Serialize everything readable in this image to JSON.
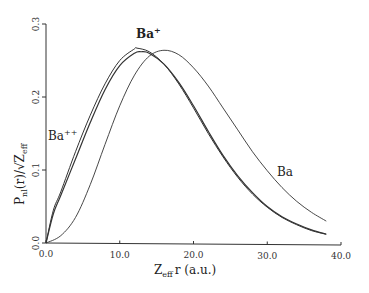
{
  "chart_data": {
    "type": "line",
    "title": "",
    "xlabel": "Z_eff r (a.u.)",
    "ylabel": "P_nl(r)/√Z_eff",
    "xlim": [
      0,
      40
    ],
    "ylim": [
      0,
      0.3
    ],
    "x_ticks": [
      "0.0",
      "10.0",
      "20.0",
      "30.0",
      "40.0"
    ],
    "y_ticks": [
      "0.0",
      "0.1",
      "0.2",
      "0.3"
    ],
    "grid": false,
    "legend": "inline labels",
    "series": [
      {
        "name": "Ba++",
        "label": "Ba⁺⁺",
        "x": [
          0,
          1,
          2,
          4,
          6,
          8,
          10,
          12,
          12.3,
          14,
          16,
          18,
          20,
          22,
          24,
          26,
          28,
          30,
          32,
          34,
          36,
          38
        ],
        "y": [
          0,
          0.045,
          0.07,
          0.125,
          0.175,
          0.218,
          0.25,
          0.266,
          0.267,
          0.262,
          0.245,
          0.218,
          0.185,
          0.15,
          0.118,
          0.09,
          0.067,
          0.049,
          0.035,
          0.025,
          0.017,
          0.012
        ]
      },
      {
        "name": "Ba+",
        "label": "Ba⁺",
        "x": [
          0,
          1,
          2,
          4,
          6,
          8,
          10,
          12,
          12.9,
          14,
          16,
          18,
          20,
          22,
          24,
          26,
          28,
          30,
          32,
          34,
          36,
          38
        ],
        "y": [
          0,
          0.04,
          0.065,
          0.115,
          0.165,
          0.21,
          0.243,
          0.26,
          0.262,
          0.26,
          0.245,
          0.22,
          0.188,
          0.153,
          0.12,
          0.092,
          0.069,
          0.05,
          0.036,
          0.026,
          0.018,
          0.012
        ]
      },
      {
        "name": "Ba",
        "label": "Ba",
        "x": [
          0,
          2,
          4,
          6,
          8,
          10,
          12,
          14,
          16,
          18,
          20,
          22,
          24,
          26,
          28,
          30,
          32,
          34,
          36,
          38
        ],
        "y": [
          0,
          0.01,
          0.035,
          0.08,
          0.135,
          0.188,
          0.23,
          0.256,
          0.264,
          0.258,
          0.24,
          0.215,
          0.185,
          0.155,
          0.125,
          0.099,
          0.076,
          0.057,
          0.042,
          0.03
        ]
      }
    ]
  },
  "labels": {
    "ba_pp": "Ba",
    "ba_pp_sup": "++",
    "ba_p": "Ba",
    "ba_p_sup": "+",
    "ba": "Ba",
    "x_axis_main": "Z",
    "x_axis_sub": "eff",
    "x_axis_rest": "r  (a.u.)",
    "y_axis_main": "P",
    "y_axis_sub": "nl",
    "y_axis_mid": "(r)/√Z",
    "y_axis_sub2": "eff"
  }
}
